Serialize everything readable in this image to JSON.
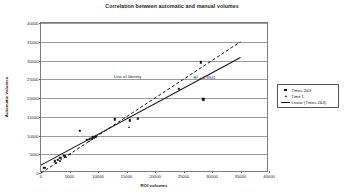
{
  "chart_data": {
    "type": "scatter",
    "title": "Correlation between automatic and manual volumes",
    "xlabel": "ROI volumes",
    "ylabel": "Automatic volumes",
    "xlim": [
      0,
      40000
    ],
    "ylim": [
      0,
      40000
    ],
    "grid": "horizontal",
    "legend_position": "right",
    "xticks": [
      "0",
      "5000",
      "10000",
      "15000",
      "20000",
      "25000",
      "30000",
      "35000",
      "40000"
    ],
    "yticks": [
      "0",
      "5000",
      "10000",
      "15000",
      "20000",
      "25000",
      "30000",
      "35000",
      "40000"
    ],
    "xtick_values": [
      0,
      5000,
      10000,
      15000,
      20000,
      25000,
      30000,
      35000,
      40000
    ],
    "ytick_values": [
      0,
      5000,
      10000,
      15000,
      20000,
      25000,
      30000,
      35000,
      40000
    ],
    "series": [
      {
        "name": "Times 2&3",
        "marker": "square",
        "points": [
          [
            600,
            1400
          ],
          [
            2400,
            3100
          ],
          [
            3000,
            3500
          ],
          [
            3400,
            4100
          ],
          [
            4100,
            4600
          ],
          [
            6800,
            11200
          ],
          [
            8000,
            8800
          ],
          [
            8600,
            9100
          ],
          [
            9200,
            9500
          ],
          [
            9600,
            9700
          ],
          [
            13000,
            14300
          ],
          [
            15600,
            14100
          ],
          [
            17000,
            14500
          ],
          [
            24200,
            22400
          ],
          [
            28000,
            29500
          ],
          [
            28500,
            19700
          ]
        ]
      },
      {
        "name": "Time 1",
        "marker": "triangle",
        "points": [
          [
            2700,
            2600
          ],
          [
            3300,
            3300
          ],
          [
            4400,
            4400
          ],
          [
            5100,
            5000
          ],
          [
            8400,
            8600
          ],
          [
            9000,
            9200
          ],
          [
            15500,
            12300
          ],
          [
            17100,
            14600
          ]
        ]
      }
    ],
    "trendlines": [
      {
        "name": "Linear (Times 2&3)",
        "style": "solid",
        "from": [
          0,
          2100
        ],
        "to": [
          35000,
          30800
        ],
        "annotation": "R² = 0.9341"
      },
      {
        "name": "Line of Identity",
        "style": "dashed",
        "from": [
          0,
          0
        ],
        "to": [
          35000,
          35000
        ],
        "annotation": "Line of Identity"
      }
    ],
    "annotations": [
      {
        "text": "Line of Identity",
        "x": 15200,
        "y": 25800
      },
      {
        "text": "R² = 0.9341",
        "x": 28700,
        "y": 25600
      }
    ],
    "legend": [
      {
        "label": "Times 2&3",
        "key": "square-marker-icon"
      },
      {
        "label": "Time 1",
        "key": "triangle-marker-icon"
      },
      {
        "label": "Linear (Times 2&3)",
        "key": "solid-line-icon"
      }
    ]
  }
}
